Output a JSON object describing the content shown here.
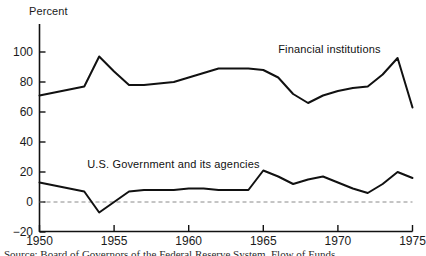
{
  "chart_data": {
    "type": "line",
    "title": "",
    "subtitle": "",
    "xlabel": "",
    "ylabel": "Percent",
    "ylim": [
      -20,
      110
    ],
    "xlim": [
      1950,
      1975
    ],
    "grid": false,
    "zero_line": true,
    "legend_position": "inline-annotation",
    "y_ticks": [
      100,
      80,
      60,
      40,
      20,
      0,
      -20
    ],
    "y_tick_labels": [
      "100",
      "80",
      "60",
      "40",
      "20",
      "0",
      "−20"
    ],
    "x_ticks": [
      1950,
      1955,
      1960,
      1965,
      1970,
      1975
    ],
    "x_tick_labels": [
      "1950",
      "1955",
      "1960",
      "1965",
      "1970",
      "1975"
    ],
    "x": [
      1950,
      1951,
      1952,
      1953,
      1954,
      1955,
      1956,
      1957,
      1958,
      1959,
      1960,
      1961,
      1962,
      1963,
      1964,
      1965,
      1966,
      1967,
      1968,
      1969,
      1970,
      1971,
      1972,
      1973,
      1974,
      1975
    ],
    "series": [
      {
        "name": "Financial institutions",
        "color": "#111111",
        "label_x": 1966.0,
        "label_y": 101,
        "values": [
          71,
          73,
          75,
          77,
          97,
          87,
          78,
          78,
          79,
          80,
          83,
          86,
          89,
          89,
          89,
          88,
          83,
          72,
          66,
          71,
          74,
          76,
          77,
          85,
          96,
          63
        ]
      },
      {
        "name": "U.S. Government and its agencies",
        "color": "#111111",
        "label_x": 1953.2,
        "label_y": 24,
        "values": [
          13,
          11,
          9,
          7,
          -7,
          0,
          7,
          8,
          8,
          8,
          9,
          9,
          8,
          8,
          8,
          21,
          17,
          12,
          15,
          17,
          13,
          9,
          6,
          12,
          20,
          16
        ]
      }
    ],
    "annotations": [
      {
        "text": "Financial institutions"
      },
      {
        "text": "U.S. Government and its agencies"
      }
    ]
  },
  "axis": {
    "y_title": "Percent"
  },
  "caption": {
    "text": "Source: Board of Governors of the Federal Reserve System, Flow of Funds"
  }
}
